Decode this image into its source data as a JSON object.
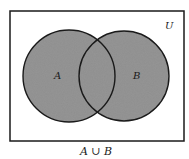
{
  "diagram": {
    "type": "venn",
    "universe_label": "U",
    "sets": [
      {
        "label": "A",
        "cx": 69,
        "cy": 76,
        "r": 46
      },
      {
        "label": "B",
        "cx": 124,
        "cy": 76,
        "r": 45
      }
    ],
    "shaded_region": "A ∪ B",
    "caption": "A ∪ B",
    "colors": {
      "fill": "#8f8f8f",
      "stroke": "#1a1a1a",
      "background": "#ffffff"
    }
  }
}
